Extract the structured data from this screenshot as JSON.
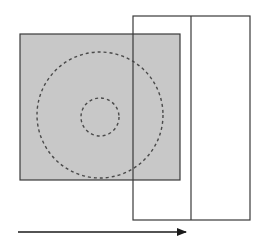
{
  "diagram": {
    "colors": {
      "background": "#ffffff",
      "square_fill": "#c8c8c8",
      "stroke": "#3a3a3a",
      "dashed_circle": "#4a4a4a",
      "frame_fill": "#ffffff"
    },
    "gray_square": {
      "x": 20,
      "y": 34,
      "width": 160,
      "height": 146
    },
    "outer_circle": {
      "cx": 100,
      "cy": 115,
      "r": 63
    },
    "inner_circle": {
      "cx": 100,
      "cy": 117,
      "r": 19
    },
    "frame": {
      "x": 133,
      "y": 16,
      "width": 117,
      "height": 79,
      "height_total": 204,
      "divider_x": 191
    },
    "arrow": {
      "x1": 18,
      "y1": 232,
      "x2": 186,
      "y2": 232,
      "direction": "right"
    }
  }
}
